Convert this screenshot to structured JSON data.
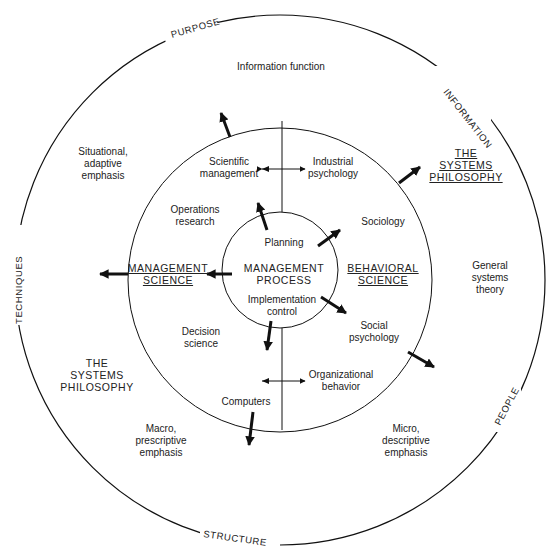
{
  "ring_labels": {
    "purpose": "PURPOSE",
    "information": "INFORMATION",
    "techniques": "TECHNIQUES",
    "people": "PEOPLE",
    "structure": "STRUCTURE"
  },
  "outer": {
    "information_function": "Information function",
    "situational": "Situational,\nadaptive\nemphasis",
    "systems_philosophy_right": "THE\nSYSTEMS\nPHILOSOPHY",
    "general_systems": "General\nsystems\ntheory",
    "systems_philosophy_left": "THE\nSYSTEMS\nPHILOSOPHY",
    "macro": "Macro,\nprescriptive\nemphasis",
    "micro": "Micro,\ndescriptive\nemphasis"
  },
  "middle": {
    "scientific_management": "Scientific\nmanagement",
    "industrial_psychology": "Industrial\npsychology",
    "operations_research": "Operations\nresearch",
    "sociology": "Sociology",
    "management_science": "MANAGEMENT\nSCIENCE",
    "behavioral_science": "BEHAVIORAL\nSCIENCE",
    "decision_science": "Decision\nscience",
    "social_psychology": "Social\npsychology",
    "computers": "Computers",
    "organizational_behavior": "Organizational\nbehavior"
  },
  "inner": {
    "planning": "Planning",
    "management_process": "MANAGEMENT\nPROCESS",
    "implementation_control": "Implementation\ncontrol"
  }
}
